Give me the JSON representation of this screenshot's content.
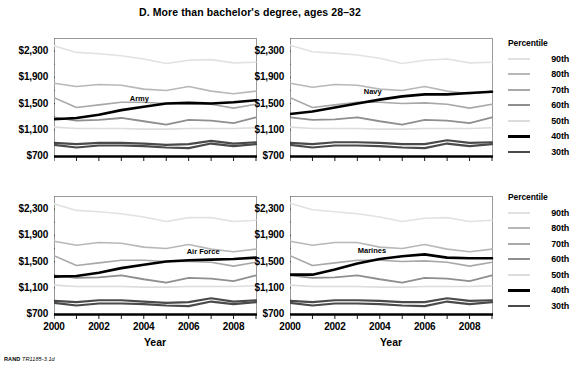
{
  "figure": {
    "title": "D. More than bachelor's degree, ages 28–32",
    "source_note_bold": "RAND",
    "source_note_italic": "TR1185-3.1d"
  },
  "axes": {
    "x_title": "Year",
    "x_tick_labels": [
      "2000",
      "2002",
      "2004",
      "2006",
      "2008"
    ],
    "y_tick_labels": [
      "$2,300",
      "$1,900",
      "$1,500",
      "$1,100",
      "$700"
    ]
  },
  "legend": {
    "title": "Percentile",
    "items": [
      {
        "label": "90th",
        "color": "#e2e2e2",
        "width": 1.6
      },
      {
        "label": "80th",
        "color": "#b8b8b8",
        "width": 1.6
      },
      {
        "label": "70th",
        "color": "#a8a8a8",
        "width": 1.6
      },
      {
        "label": "60th",
        "color": "#8f8f8f",
        "width": 1.8
      },
      {
        "label": "50th",
        "color": "#dcdcdc",
        "width": 1.6
      },
      {
        "label": "40th",
        "color": "#000000",
        "width": 2.6
      },
      {
        "label": "30th",
        "color": "#4a4a4a",
        "width": 2.2
      }
    ]
  },
  "chart_data": {
    "type": "line",
    "title": "D. More than bachelor's degree, ages 28–32",
    "xlabel": "Year",
    "ylabel": "",
    "xlim": [
      2000,
      2009
    ],
    "ylim": [
      700,
      2500
    ],
    "grid": false,
    "legend_position": "right",
    "x": [
      2000,
      2001,
      2002,
      2003,
      2004,
      2005,
      2006,
      2007,
      2008,
      2009
    ],
    "panels": [
      {
        "name": "Army",
        "annotation": "Army",
        "series": [
          {
            "name": "90th",
            "values": [
              2380,
              2280,
              2260,
              2230,
              2180,
              2110,
              2160,
              2170,
              2120,
              2130
            ]
          },
          {
            "name": "80th",
            "values": [
              1810,
              1760,
              1790,
              1780,
              1720,
              1700,
              1760,
              1690,
              1650,
              1690
            ]
          },
          {
            "name": "70th",
            "values": [
              1590,
              1440,
              1480,
              1520,
              1520,
              1500,
              1500,
              1490,
              1430,
              1490
            ]
          },
          {
            "name": "60th",
            "values": [
              1290,
              1240,
              1250,
              1280,
              1230,
              1180,
              1250,
              1240,
              1200,
              1290
            ]
          },
          {
            "name": "50th",
            "values": [
              1140,
              1120,
              1120,
              1120,
              1110,
              1110,
              1120,
              1120,
              1120,
              1130
            ]
          },
          {
            "name": "40th",
            "values": [
              1260,
              1280,
              1330,
              1400,
              1450,
              1500,
              1510,
              1500,
              1520,
              1550
            ]
          },
          {
            "name": "30th",
            "values": [
              900,
              880,
              900,
              900,
              890,
              870,
              880,
              930,
              890,
              910
            ]
          },
          {
            "name": "30th-lower",
            "values": [
              870,
              830,
              860,
              860,
              850,
              830,
              820,
              890,
              850,
              880
            ]
          }
        ]
      },
      {
        "name": "Navy",
        "annotation": "Navy",
        "series": [
          {
            "name": "90th",
            "values": [
              2390,
              2290,
              2270,
              2240,
              2190,
              2110,
              2160,
              2180,
              2120,
              2130
            ]
          },
          {
            "name": "80th",
            "values": [
              1810,
              1750,
              1790,
              1780,
              1720,
              1700,
              1760,
              1690,
              1650,
              1690
            ]
          },
          {
            "name": "70th",
            "values": [
              1590,
              1440,
              1480,
              1520,
              1520,
              1500,
              1510,
              1490,
              1430,
              1490
            ]
          },
          {
            "name": "60th",
            "values": [
              1290,
              1250,
              1260,
              1290,
              1230,
              1180,
              1250,
              1240,
              1200,
              1290
            ]
          },
          {
            "name": "50th",
            "values": [
              1140,
              1120,
              1120,
              1120,
              1110,
              1110,
              1120,
              1120,
              1120,
              1130
            ]
          },
          {
            "name": "40th",
            "values": [
              1340,
              1380,
              1440,
              1500,
              1560,
              1610,
              1640,
              1640,
              1660,
              1680
            ]
          },
          {
            "name": "30th",
            "values": [
              900,
              880,
              910,
              910,
              900,
              880,
              880,
              940,
              900,
              910
            ]
          },
          {
            "name": "30th-lower",
            "values": [
              870,
              830,
              860,
              860,
              850,
              830,
              820,
              890,
              850,
              880
            ]
          }
        ]
      },
      {
        "name": "Air Force",
        "annotation": "Air Force",
        "series": [
          {
            "name": "90th",
            "values": [
              2380,
              2280,
              2260,
              2230,
              2180,
              2110,
              2170,
              2170,
              2110,
              2130
            ]
          },
          {
            "name": "80th",
            "values": [
              1810,
              1750,
              1790,
              1780,
              1720,
              1700,
              1760,
              1690,
              1650,
              1690
            ]
          },
          {
            "name": "70th",
            "values": [
              1590,
              1440,
              1480,
              1520,
              1520,
              1500,
              1500,
              1490,
              1430,
              1490
            ]
          },
          {
            "name": "60th",
            "values": [
              1290,
              1250,
              1260,
              1290,
              1230,
              1180,
              1250,
              1240,
              1200,
              1290
            ]
          },
          {
            "name": "50th",
            "values": [
              1140,
              1120,
              1120,
              1120,
              1110,
              1110,
              1120,
              1120,
              1120,
              1130
            ]
          },
          {
            "name": "40th",
            "values": [
              1270,
              1280,
              1330,
              1400,
              1450,
              1500,
              1520,
              1530,
              1540,
              1560
            ]
          },
          {
            "name": "30th",
            "values": [
              900,
              880,
              910,
              910,
              890,
              870,
              880,
              940,
              890,
              910
            ]
          },
          {
            "name": "30th-lower",
            "values": [
              870,
              830,
              860,
              860,
              850,
              830,
              820,
              890,
              850,
              880
            ]
          }
        ]
      },
      {
        "name": "Marines",
        "annotation": "Marines",
        "series": [
          {
            "name": "90th",
            "values": [
              2390,
              2290,
              2260,
              2230,
              2180,
              2110,
              2160,
              2170,
              2110,
              2130
            ]
          },
          {
            "name": "80th",
            "values": [
              1810,
              1750,
              1790,
              1790,
              1720,
              1700,
              1760,
              1690,
              1650,
              1690
            ]
          },
          {
            "name": "70th",
            "values": [
              1590,
              1440,
              1480,
              1520,
              1520,
              1500,
              1510,
              1490,
              1430,
              1490
            ]
          },
          {
            "name": "60th",
            "values": [
              1290,
              1250,
              1260,
              1290,
              1230,
              1180,
              1250,
              1240,
              1200,
              1290
            ]
          },
          {
            "name": "50th",
            "values": [
              1140,
              1120,
              1120,
              1120,
              1110,
              1110,
              1120,
              1120,
              1120,
              1130
            ]
          },
          {
            "name": "40th",
            "values": [
              1300,
              1300,
              1380,
              1470,
              1540,
              1580,
              1610,
              1560,
              1550,
              1550
            ]
          },
          {
            "name": "30th",
            "values": [
              900,
              880,
              910,
              910,
              900,
              880,
              880,
              940,
              900,
              910
            ]
          },
          {
            "name": "30th-lower",
            "values": [
              870,
              830,
              860,
              860,
              850,
              830,
              820,
              890,
              850,
              880
            ]
          }
        ]
      }
    ]
  }
}
